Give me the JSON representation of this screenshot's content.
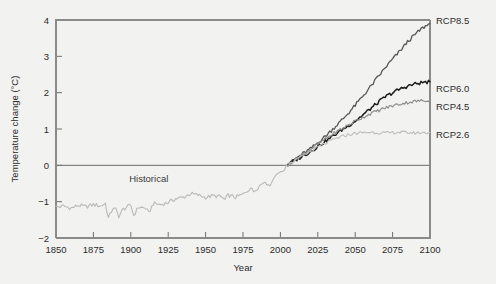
{
  "chart_data": {
    "type": "line",
    "title": "",
    "xlabel": "Year",
    "ylabel": "Temperature change (°C)",
    "xlim": [
      1850,
      2100
    ],
    "ylim": [
      -2,
      4
    ],
    "xticks": [
      1850,
      1875,
      1900,
      1925,
      1950,
      1975,
      2000,
      2025,
      2050,
      2075,
      2100
    ],
    "yticks": [
      -2,
      -1,
      0,
      1,
      2,
      3,
      4
    ],
    "grid": false,
    "legend_position": "right-inline-labels",
    "zero_reference_line": 0,
    "annotations": [
      {
        "text": "Historical",
        "x": 1912,
        "y": -0.45
      }
    ],
    "series": [
      {
        "name": "Historical",
        "color": "#b9b9b9",
        "label": "Historical",
        "x": [
          1850,
          1855,
          1860,
          1865,
          1870,
          1875,
          1880,
          1883,
          1885,
          1888,
          1890,
          1892,
          1895,
          1900,
          1902,
          1905,
          1910,
          1912,
          1915,
          1920,
          1925,
          1930,
          1935,
          1940,
          1945,
          1950,
          1955,
          1960,
          1963,
          1965,
          1970,
          1975,
          1980,
          1982,
          1985,
          1990,
          1992,
          1995,
          1998,
          2000,
          2003,
          2005
        ],
        "values": [
          -1.15,
          -1.12,
          -1.18,
          -1.1,
          -1.14,
          -1.08,
          -1.12,
          -1.05,
          -1.45,
          -1.18,
          -1.22,
          -1.4,
          -1.2,
          -1.1,
          -1.38,
          -1.15,
          -1.18,
          -1.32,
          -1.05,
          -1.08,
          -1.02,
          -0.92,
          -0.88,
          -0.78,
          -0.82,
          -0.88,
          -0.84,
          -0.86,
          -0.95,
          -0.82,
          -0.88,
          -0.8,
          -0.62,
          -0.72,
          -0.6,
          -0.42,
          -0.58,
          -0.4,
          -0.18,
          -0.22,
          -0.08,
          0.02
        ]
      },
      {
        "name": "RCP8.5",
        "color": "#555555",
        "label": "RCP8.5",
        "end_value": 3.9,
        "x": [
          2005,
          2010,
          2015,
          2020,
          2025,
          2030,
          2035,
          2040,
          2045,
          2050,
          2055,
          2060,
          2065,
          2070,
          2075,
          2080,
          2085,
          2090,
          2095,
          2100
        ],
        "values": [
          0.02,
          0.18,
          0.32,
          0.45,
          0.62,
          0.8,
          1.0,
          1.2,
          1.42,
          1.65,
          1.9,
          2.15,
          2.42,
          2.68,
          2.92,
          3.15,
          3.4,
          3.6,
          3.78,
          3.9
        ]
      },
      {
        "name": "RCP6.0",
        "color": "#1c1c1c",
        "label": "RCP6.0",
        "end_value": 2.3,
        "x": [
          2005,
          2010,
          2015,
          2020,
          2025,
          2030,
          2035,
          2040,
          2045,
          2050,
          2055,
          2060,
          2065,
          2070,
          2075,
          2080,
          2085,
          2090,
          2095,
          2100
        ],
        "values": [
          0.02,
          0.14,
          0.26,
          0.38,
          0.52,
          0.66,
          0.8,
          0.95,
          1.08,
          1.22,
          1.38,
          1.55,
          1.72,
          1.88,
          2.0,
          2.1,
          2.18,
          2.24,
          2.28,
          2.3
        ]
      },
      {
        "name": "RCP4.5",
        "color": "#8e8e8e",
        "label": "RCP4.5",
        "end_value": 1.8,
        "x": [
          2005,
          2010,
          2015,
          2020,
          2025,
          2030,
          2035,
          2040,
          2045,
          2050,
          2055,
          2060,
          2065,
          2070,
          2075,
          2080,
          2085,
          2090,
          2095,
          2100
        ],
        "values": [
          0.02,
          0.16,
          0.3,
          0.44,
          0.58,
          0.72,
          0.86,
          0.98,
          1.1,
          1.22,
          1.32,
          1.42,
          1.5,
          1.58,
          1.64,
          1.69,
          1.73,
          1.76,
          1.78,
          1.8
        ]
      },
      {
        "name": "RCP2.6",
        "color": "#bdbdbd",
        "label": "RCP2.6",
        "end_value": 0.9,
        "x": [
          2005,
          2010,
          2015,
          2020,
          2025,
          2030,
          2035,
          2040,
          2045,
          2050,
          2055,
          2060,
          2065,
          2070,
          2075,
          2080,
          2085,
          2090,
          2095,
          2100
        ],
        "values": [
          0.02,
          0.14,
          0.26,
          0.38,
          0.5,
          0.6,
          0.7,
          0.78,
          0.84,
          0.88,
          0.9,
          0.91,
          0.9,
          0.89,
          0.9,
          0.91,
          0.9,
          0.89,
          0.9,
          0.9
        ]
      }
    ]
  }
}
